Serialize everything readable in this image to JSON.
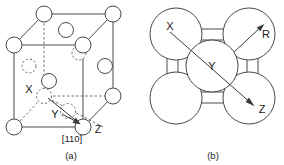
{
  "figure": {
    "panels": [
      {
        "id": "a",
        "caption": "(a)",
        "kind": "fcc-unit-cell-perspective",
        "labels": {
          "x": "X",
          "y": "Y",
          "z": "Z",
          "direction": "[110]"
        },
        "atoms": {
          "corner_count": 8,
          "face_center_count": 6,
          "visible_solid": 10,
          "hidden_dashed": 4
        },
        "vectors": [
          {
            "name": "x-to-z",
            "from": "X",
            "to": "Z",
            "label": "[110]"
          },
          {
            "name": "y-to-z",
            "from": "Y",
            "to": "Z",
            "label": ""
          }
        ]
      },
      {
        "id": "b",
        "caption": "(b)",
        "kind": "close-packed-plane-hard-sphere",
        "labels": {
          "x": "X",
          "y": "Y",
          "z": "Z",
          "radius": "R"
        },
        "atoms": {
          "corner_count": 4,
          "center_count": 1,
          "neck_count": 4
        },
        "vectors": [
          {
            "name": "x-to-z-diagonal",
            "from": "X",
            "to": "Z"
          },
          {
            "name": "radius-arrow",
            "label": "R"
          }
        ]
      }
    ],
    "colors": {
      "line": "#4a4a4a",
      "hidden_line": "#6b6b6b",
      "text": "#1a1a1a",
      "background": "#ffffff"
    }
  }
}
